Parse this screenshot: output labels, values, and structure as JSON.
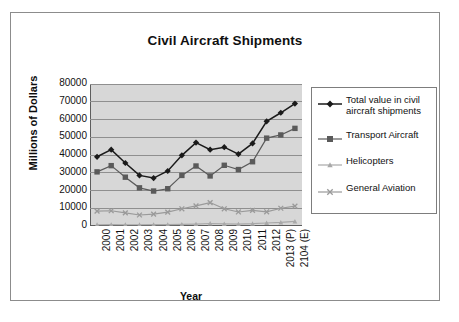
{
  "chart_data": {
    "type": "line",
    "title": "Civil Aircraft Shipments",
    "xlabel": "Year",
    "ylabel": "Millions of Dollars",
    "categories": [
      "2000",
      "2001",
      "2002",
      "2003",
      "2004",
      "2005",
      "2006",
      "2007",
      "2008",
      "2009",
      "2010",
      "2011",
      "2012",
      "2013 (P)",
      "2104 (E)"
    ],
    "ylim": [
      0,
      80000
    ],
    "ytick_labels": [
      "80000",
      "70000",
      "60000",
      "50000",
      "40000",
      "30000",
      "20000",
      "10000",
      "0"
    ],
    "ytick_values": [
      80000,
      70000,
      60000,
      50000,
      40000,
      30000,
      20000,
      10000,
      0
    ],
    "grid": true,
    "legend_position": "right",
    "series": [
      {
        "name": "Total value in civil aircraft shipments",
        "marker": "diamond",
        "color": "#1a1a1a",
        "values": [
          39000,
          43000,
          35500,
          28500,
          27000,
          31000,
          39800,
          47000,
          43000,
          44400,
          40500,
          46500,
          59000,
          63800,
          69000
        ]
      },
      {
        "name": "Transport Aircraft",
        "marker": "square",
        "color": "#5a5a5a",
        "values": [
          30500,
          34000,
          27500,
          21500,
          19700,
          21000,
          28500,
          33800,
          28200,
          34200,
          31800,
          36200,
          49500,
          51300,
          55000
        ]
      },
      {
        "name": "Helicopters",
        "marker": "triangle",
        "color": "#a8a8a8",
        "values": [
          700,
          800,
          700,
          700,
          800,
          800,
          900,
          1100,
          1400,
          1200,
          1100,
          1300,
          1700,
          2000,
          2600
        ]
      },
      {
        "name": "General Aviation",
        "marker": "cross",
        "color": "#9a9a9a",
        "values": [
          8400,
          8600,
          7400,
          6200,
          6700,
          7800,
          9700,
          11300,
          13200,
          9700,
          7900,
          8800,
          8000,
          10000,
          11200
        ]
      }
    ]
  },
  "legend": {
    "entries": [
      {
        "label": "Total value in civil aircraft shipments",
        "marker": "diamond-marker-icon"
      },
      {
        "label": "Transport Aircraft",
        "marker": "square-marker-icon"
      },
      {
        "label": "Helicopters",
        "marker": "triangle-marker-icon"
      },
      {
        "label": "General Aviation",
        "marker": "cross-marker-icon"
      }
    ]
  },
  "ghost_text": {
    "line1": " ",
    "line2": " "
  }
}
